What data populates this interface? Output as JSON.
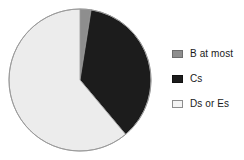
{
  "chart_data": {
    "type": "pie",
    "title": "",
    "categories": [
      "B at most",
      "Cs",
      "Ds or Es"
    ],
    "values": [
      2.5,
      36.5,
      61.0
    ],
    "unit": "percent",
    "start_angle_deg": 0,
    "direction": "clockwise",
    "colors": [
      "#8e8e8e",
      "#1c1c1c",
      "#ececec"
    ],
    "edge_color": "#9a9a9a",
    "legend": {
      "position": "right",
      "entries": [
        {
          "label": "B at most",
          "color": "#8e8e8e",
          "border": "#6d6d6d"
        },
        {
          "label": "Cs",
          "color": "#1c1c1c",
          "border": "#111111"
        },
        {
          "label": "Ds or Es",
          "color": "#f4f4f4",
          "border": "#8d8d8d"
        }
      ]
    },
    "grid": false,
    "xlabel": "",
    "ylabel": "",
    "labels_shown": false
  },
  "figure": {
    "background": "#ffffff",
    "pie": {
      "center_x": 80,
      "center_y": 80,
      "radius": 71,
      "slices": [
        {
          "name": "B at most",
          "start_deg": 0,
          "end_deg": 9,
          "fill": "#8e8e8e"
        },
        {
          "name": "Cs",
          "start_deg": 9,
          "end_deg": 140,
          "fill": "#1c1c1c"
        },
        {
          "name": "Ds or Es",
          "start_deg": 140,
          "end_deg": 360,
          "fill": "#ececec"
        }
      ]
    }
  }
}
